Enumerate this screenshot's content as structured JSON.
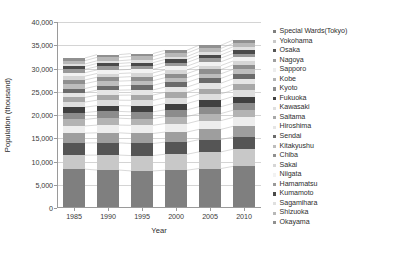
{
  "chart_data": {
    "type": "bar",
    "subtype": "stacked-bar",
    "title": "",
    "xlabel": "Year",
    "ylabel": "Population (thousand)",
    "categories": [
      "1985",
      "1990",
      "1995",
      "2000",
      "2005",
      "2010"
    ],
    "ylim": [
      0,
      40000
    ],
    "ytick_labels": [
      "0",
      "5,000",
      "10,000",
      "15,000",
      "20,000",
      "25,000",
      "30,000",
      "35,000",
      "40,000"
    ],
    "ytick_values": [
      0,
      5000,
      10000,
      15000,
      20000,
      25000,
      30000,
      35000,
      40000
    ],
    "grid": true,
    "legend_position": "right",
    "connector_lines": true,
    "series": [
      {
        "name": "Special Wards(Tokyo)",
        "color": "#7f7f7f",
        "values": [
          8355,
          8164,
          7968,
          8135,
          8490,
          8946
        ]
      },
      {
        "name": "Yokohama",
        "color": "#c8c8c8",
        "values": [
          2993,
          3220,
          3307,
          3427,
          3580,
          3689
        ]
      },
      {
        "name": "Osaka",
        "color": "#555555",
        "values": [
          2636,
          2624,
          2602,
          2599,
          2629,
          2665
        ]
      },
      {
        "name": "Nagoya",
        "color": "#9e9e9e",
        "values": [
          2116,
          2155,
          2152,
          2172,
          2215,
          2264
        ]
      },
      {
        "name": "Sapporo",
        "color": "#ededed",
        "values": [
          1543,
          1672,
          1757,
          1822,
          1880,
          1914
        ]
      },
      {
        "name": "Kobe",
        "color": "#b3b3b3",
        "values": [
          1410,
          1477,
          1424,
          1493,
          1525,
          1544
        ]
      },
      {
        "name": "Kyoto",
        "color": "#8c8c8c",
        "values": [
          1479,
          1461,
          1464,
          1468,
          1475,
          1474
        ]
      },
      {
        "name": "Fukuoka",
        "color": "#404040",
        "values": [
          1160,
          1237,
          1285,
          1341,
          1401,
          1464
        ]
      },
      {
        "name": "Kawasaki",
        "color": "#dedede",
        "values": [
          1089,
          1174,
          1203,
          1250,
          1327,
          1426
        ]
      },
      {
        "name": "Saitama",
        "color": "#a8a8a8",
        "values": [
          1011,
          1074,
          1124,
          1172,
          1176,
          1222
        ]
      },
      {
        "name": "Hiroshima",
        "color": "#e5e5e5",
        "values": [
          1044,
          1086,
          1109,
          1126,
          1154,
          1174
        ]
      },
      {
        "name": "Sendai",
        "color": "#6b6b6b",
        "values": [
          857,
          918,
          971,
          1008,
          1025,
          1046
        ]
      },
      {
        "name": "Kitakyushu",
        "color": "#bdbdbd",
        "values": [
          1056,
          1026,
          1020,
          1011,
          994,
          977
        ]
      },
      {
        "name": "Chiba",
        "color": "#8f8f8f",
        "values": [
          789,
          829,
          857,
          887,
          924,
          962
        ]
      },
      {
        "name": "Sakai",
        "color": "#d6d6d6",
        "values": [
          818,
          808,
          802,
          792,
          831,
          842
        ]
      },
      {
        "name": "Niigata",
        "color": "#f2f2f2",
        "values": [
          745,
          765,
          780,
          793,
          813,
          812
        ]
      },
      {
        "name": "Hamamatsu",
        "color": "#999999",
        "values": [
          724,
          752,
          774,
          786,
          804,
          801
        ]
      },
      {
        "name": "Kumamoto",
        "color": "#4a4a4a",
        "values": [
          616,
          640,
          657,
          662,
          670,
          734
        ]
      },
      {
        "name": "Sagamihara",
        "color": "#e0e0e0",
        "values": [
          539,
          584,
          606,
          630,
          701,
          718
        ]
      },
      {
        "name": "Shizuoka",
        "color": "#b8b8b8",
        "values": [
          712,
          722,
          726,
          716,
          714,
          716
        ]
      },
      {
        "name": "Okayama",
        "color": "#909090",
        "values": [
          572,
          594,
          616,
          627,
          674,
          710
        ]
      }
    ]
  },
  "legend": {
    "items": [
      {
        "label": "Special Wards(Tokyo)"
      },
      {
        "label": "Yokohama"
      },
      {
        "label": "Osaka"
      },
      {
        "label": "Nagoya"
      },
      {
        "label": "Sapporo"
      },
      {
        "label": "Kobe"
      },
      {
        "label": "Kyoto"
      },
      {
        "label": "Fukuoka"
      },
      {
        "label": "Kawasaki"
      },
      {
        "label": "Saitama"
      },
      {
        "label": "Hiroshima"
      },
      {
        "label": "Sendai"
      },
      {
        "label": "Kitakyushu"
      },
      {
        "label": "Chiba"
      },
      {
        "label": "Sakai"
      },
      {
        "label": "Niigata"
      },
      {
        "label": "Hamamatsu"
      },
      {
        "label": "Kumamoto"
      },
      {
        "label": "Sagamihara"
      },
      {
        "label": "Shizuoka"
      },
      {
        "label": "Okayama"
      }
    ]
  },
  "axes": {
    "x_title": "Year",
    "y_title": "Population (thousand)"
  },
  "colors": {
    "gridline": "#d4d4d4",
    "axis": "#9a9a9a",
    "text": "#2e2e2e",
    "background": "#ffffff"
  }
}
